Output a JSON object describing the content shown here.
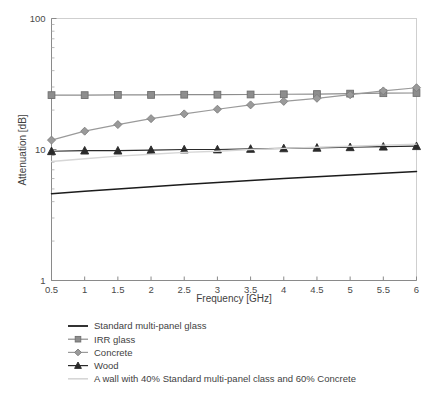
{
  "chart_data": {
    "type": "line",
    "title": "",
    "xlabel": "Frequency [GHz]",
    "ylabel": "Attenuation [dB]",
    "x": [
      0.5,
      1,
      1.5,
      2,
      2.5,
      3,
      3.5,
      4,
      4.5,
      5,
      5.5,
      6
    ],
    "xtick_labels": [
      "0.5",
      "1",
      "1.5",
      "2",
      "2.5",
      "3",
      "3.5",
      "4",
      "4.5",
      "5",
      "5.5",
      "6"
    ],
    "xlim": [
      0.5,
      6
    ],
    "yscale": "log",
    "ylim": [
      1,
      100
    ],
    "ytick_labels": [
      "1",
      "10",
      "100"
    ],
    "yticks": [
      1,
      10,
      100
    ],
    "grid": false,
    "legend_position": "below-plot",
    "series": [
      {
        "name": "Standard multi-panel glass",
        "marker": "none",
        "color": "#1c1c1c",
        "values": [
          4.6,
          4.8,
          5.0,
          5.2,
          5.4,
          5.6,
          5.8,
          6.0,
          6.2,
          6.4,
          6.6,
          6.8
        ]
      },
      {
        "name": "IRR glass",
        "marker": "square",
        "color": "#8d8d8d",
        "values": [
          26.0,
          26.0,
          26.1,
          26.1,
          26.2,
          26.2,
          26.3,
          26.4,
          26.5,
          26.7,
          26.9,
          27.0
        ]
      },
      {
        "name": "Concrete",
        "marker": "diamond",
        "color": "#9a9a9a",
        "values": [
          11.8,
          13.8,
          15.5,
          17.2,
          18.7,
          20.3,
          21.9,
          23.3,
          24.6,
          26.2,
          28.0,
          29.6
        ]
      },
      {
        "name": "Wood",
        "marker": "triangle",
        "color": "#2a2a2a",
        "values": [
          9.7,
          9.8,
          9.8,
          9.9,
          10.0,
          10.0,
          10.1,
          10.2,
          10.3,
          10.4,
          10.5,
          10.6
        ]
      },
      {
        "name": "A wall with 40% Standard multi-panel class and 60% Concrete",
        "marker": "none",
        "color": "#d6d6d6",
        "values": [
          8.1,
          8.5,
          8.9,
          9.2,
          9.5,
          9.7,
          10.0,
          10.2,
          10.4,
          10.6,
          10.8,
          11.0
        ]
      }
    ]
  },
  "legend": {
    "items": [
      {
        "label": "Standard multi-panel glass"
      },
      {
        "label": "IRR glass"
      },
      {
        "label": "Concrete"
      },
      {
        "label": "Wood"
      },
      {
        "label": "A wall with 40% Standard multi-panel class and 60% Concrete"
      }
    ]
  }
}
